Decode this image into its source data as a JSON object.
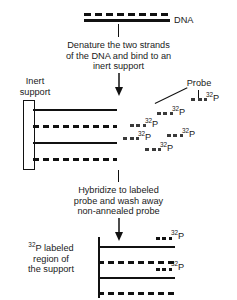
{
  "figure": {
    "title_top_label": "DNA",
    "step1_text_lines": [
      "Denature the two strands",
      "of the DNA and bind to an",
      "inert support"
    ],
    "step2_text_lines": [
      "Hybridize to labeled",
      "probe and wash away",
      "non-annealed probe"
    ],
    "inert_support_label_lines": [
      "Inert",
      "support"
    ],
    "probe_label": "Probe",
    "bottom_label_lines": [
      "labeled",
      "region of",
      "the support"
    ],
    "bottom_label_prefix_sup": "32",
    "bottom_label_prefix_base": "P",
    "isotope_superscript": "32",
    "isotope_element": "P",
    "colors": {
      "ink": "#111111",
      "fragment": "#3a3a3a",
      "background": "#ffffff"
    },
    "probe_fragments": [
      {
        "id": "probe-fragment-1",
        "x": 191,
        "y": 98,
        "w": 16,
        "label_x": 206,
        "label_y": 93
      },
      {
        "id": "probe-fragment-2",
        "x": 158,
        "y": 111,
        "w": 16,
        "label_x": 173,
        "label_y": 106
      },
      {
        "id": "probe-fragment-3",
        "x": 130,
        "y": 123,
        "w": 16,
        "label_x": 145,
        "label_y": 118
      },
      {
        "id": "probe-fragment-4",
        "x": 124,
        "y": 136,
        "w": 16,
        "label_x": 139,
        "label_y": 131
      },
      {
        "id": "probe-fragment-5",
        "x": 168,
        "y": 133,
        "w": 16,
        "label_x": 183,
        "label_y": 128
      },
      {
        "id": "probe-fragment-6",
        "x": 146,
        "y": 146,
        "w": 16,
        "label_x": 161,
        "label_y": 141
      }
    ],
    "support_strands_middle": [
      {
        "id": "support-strand-1",
        "type": "solid"
      },
      {
        "id": "support-strand-2",
        "type": "dashed"
      },
      {
        "id": "support-strand-3",
        "type": "solid"
      },
      {
        "id": "support-strand-4",
        "type": "dashed"
      }
    ],
    "support_strands_bottom": [
      {
        "id": "bottom-strand-1",
        "type": "solid",
        "labeled": true
      },
      {
        "id": "bottom-strand-2",
        "type": "dashed",
        "labeled": false
      },
      {
        "id": "bottom-strand-3",
        "type": "solid",
        "labeled": true
      },
      {
        "id": "bottom-strand-4",
        "type": "dashed",
        "labeled": false
      }
    ]
  }
}
